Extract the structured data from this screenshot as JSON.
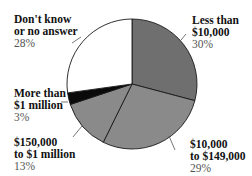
{
  "chart_data": {
    "type": "pie",
    "title": "",
    "start_angle_deg": 0,
    "direction": "clockwise",
    "slices": [
      {
        "label": "Less than $10,000",
        "value": 30,
        "color": "#6f6f6f"
      },
      {
        "label": "$10,000 to $149,000",
        "value": 29,
        "color": "#8a8a8a"
      },
      {
        "label": "$150,000 to $1 million",
        "value": 13,
        "color": "#8a8a8a"
      },
      {
        "label": "More than $1 million",
        "value": 3,
        "color": "#0a0a0a"
      },
      {
        "label": "Don't know or no answer",
        "value": 28,
        "color": "#ffffff"
      }
    ]
  },
  "labels": {
    "less10k": {
      "l1": "Less than",
      "l2": "$10,000",
      "pct": "30%"
    },
    "k10to149": {
      "l1": "$10,000",
      "l2": "to $149,000",
      "pct": "29%"
    },
    "k150to1m": {
      "l1": "$150,000",
      "l2": "to $1 million",
      "pct": "13%"
    },
    "over1m": {
      "l1": "More than",
      "l2": "$1 million",
      "pct": "3%"
    },
    "dontknow": {
      "l1": "Don't know",
      "l2": "or no answer",
      "pct": "28%"
    }
  }
}
